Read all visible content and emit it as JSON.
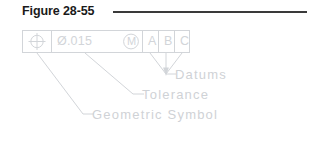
{
  "figure": {
    "title": "Figure 28-55",
    "rule_color": "#3a3a3a",
    "line_color": "#d2d5d9"
  },
  "control_frame": {
    "name": "feature-control-frame",
    "cells": [
      {
        "key": "geometric_symbol",
        "symbol": "position-symbol",
        "text": ""
      },
      {
        "key": "tolerance",
        "symbol": "diameter-mmc",
        "text": "Ø.015"
      },
      {
        "key": "datum_a",
        "symbol": "",
        "text": "A"
      },
      {
        "key": "datum_b",
        "symbol": "",
        "text": "B"
      },
      {
        "key": "datum_c",
        "symbol": "",
        "text": "C"
      }
    ],
    "tolerance_value": "Ø.015",
    "modifier": "M",
    "datum_a": "A",
    "datum_b": "B",
    "datum_c": "C"
  },
  "callouts": {
    "datums": "Datums",
    "tolerance": "Tolerance",
    "geometric_symbol": "Geometric  Symbol"
  }
}
